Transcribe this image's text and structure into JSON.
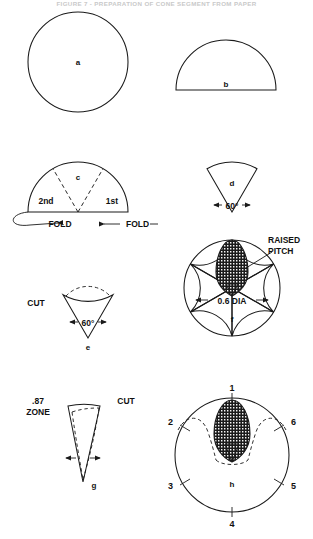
{
  "header": {
    "title": "FIGURE 7 - PREPARATION OF CONE SEGMENT FROM PAPER"
  },
  "diagram": {
    "figures": [
      {
        "id": "a",
        "label": "a",
        "shape": "full-circle",
        "description": "Full circle of paper",
        "annotations": []
      },
      {
        "id": "b",
        "label": "b",
        "shape": "semicircle",
        "description": "Circle folded once into a semicircle",
        "annotations": []
      },
      {
        "id": "c",
        "label": "c",
        "shape": "semicircle-with-folds",
        "description": "Semicircle marked with first and second fold lines",
        "annotations": [
          "2nd",
          "1st",
          "FOLD",
          "FOLD"
        ]
      },
      {
        "id": "d",
        "label": "d",
        "shape": "sector",
        "description": "Folded 60 degree sector",
        "annotations": [
          "60°"
        ]
      },
      {
        "id": "e",
        "label": "e",
        "shape": "inverted-sector-cut",
        "description": "Inverted 60 degree sector with cut arc marked",
        "annotations": [
          "CUT",
          "60°"
        ]
      },
      {
        "id": "f",
        "label": "f",
        "shape": "six-petal-rosette",
        "description": "Unfolded six petal rosette with raised pitch zone",
        "annotations": [
          "RAISED PITCH",
          "0.6 DIA"
        ]
      },
      {
        "id": "g",
        "label": "g",
        "shape": "narrow-wedge-cut",
        "description": "Narrow wedge showing the .87 zone cut",
        "annotations": [
          ".87 ZONE",
          "CUT"
        ]
      },
      {
        "id": "h",
        "label": "h",
        "shape": "numbered-circle",
        "description": "Final disc with six indexed positions",
        "annotations": [
          "1",
          "2",
          "3",
          "4",
          "5",
          "6"
        ]
      }
    ],
    "labels": {
      "fig_a": "a",
      "fig_b": "b",
      "fig_c": "c",
      "fig_d": "d",
      "fig_e": "e",
      "fig_f": "f",
      "fig_g": "g",
      "fig_h": "h",
      "second_fold": "2nd",
      "first_fold": "1st",
      "fold_left": "FOLD",
      "fold_right": "FOLD",
      "angle_d": "60°",
      "angle_e": "60°",
      "angle_g": "60°",
      "cut_e": "CUT",
      "cut_g": "CUT",
      "raised": "RAISED",
      "pitch": "PITCH",
      "dia": "0.6 DIA",
      "zone_value": ".87",
      "zone_word": "ZONE",
      "pos_1": "1",
      "pos_2": "2",
      "pos_3": "3",
      "pos_4": "4",
      "pos_5": "5",
      "pos_6": "6"
    }
  },
  "colors": {
    "ink": "#1a1a1a",
    "paper": "#ffffff",
    "hatch": "#2a2a2a",
    "faint": "#c9c9c9"
  }
}
